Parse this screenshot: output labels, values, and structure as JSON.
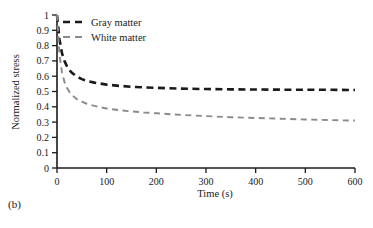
{
  "panel": {
    "label": "(b)"
  },
  "colors": {
    "gray_matter": "#1a1a1a",
    "white_matter": "#8a8a8a",
    "axis": "#1a1a1a",
    "background": "#ffffff"
  },
  "chart_data": {
    "type": "line",
    "title": "",
    "xlabel": "Time (s)",
    "ylabel": "Normalized stress",
    "xlim": [
      0,
      600
    ],
    "ylim": [
      0,
      1
    ],
    "xticks": [
      0,
      100,
      200,
      300,
      400,
      500,
      600
    ],
    "xtick_labels": [
      "0",
      "100",
      "200",
      "300",
      "400",
      "500",
      "600"
    ],
    "yticks": [
      0,
      0.1,
      0.2,
      0.3,
      0.4,
      0.5,
      0.6,
      0.7,
      0.8,
      0.9,
      1
    ],
    "ytick_labels": [
      "0",
      "0.1",
      "0.2",
      "0.3",
      "0.4",
      "0.5",
      "0.6",
      "0.7",
      "0.8",
      "0.9",
      "1"
    ],
    "grid": false,
    "legend_position": "top-left-inside",
    "linestyle": "dashed",
    "x": [
      0,
      5,
      10,
      15,
      20,
      25,
      30,
      40,
      50,
      60,
      75,
      100,
      125,
      150,
      175,
      200,
      250,
      300,
      350,
      400,
      450,
      500,
      550,
      600
    ],
    "series": [
      {
        "name": "Gray matter",
        "color": "#1a1a1a",
        "values": [
          1.0,
          0.84,
          0.75,
          0.7,
          0.665,
          0.64,
          0.622,
          0.597,
          0.581,
          0.57,
          0.558,
          0.545,
          0.537,
          0.531,
          0.527,
          0.524,
          0.519,
          0.516,
          0.514,
          0.513,
          0.512,
          0.511,
          0.511,
          0.51
        ]
      },
      {
        "name": "White matter",
        "color": "#8a8a8a",
        "values": [
          1.0,
          0.74,
          0.625,
          0.563,
          0.524,
          0.497,
          0.477,
          0.45,
          0.433,
          0.42,
          0.406,
          0.389,
          0.378,
          0.37,
          0.363,
          0.358,
          0.347,
          0.339,
          0.332,
          0.327,
          0.322,
          0.317,
          0.313,
          0.31
        ]
      }
    ]
  }
}
